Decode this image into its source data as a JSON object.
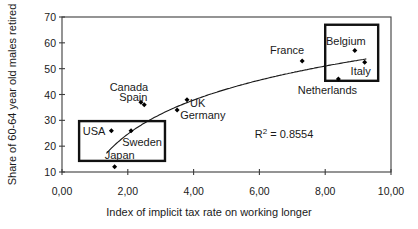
{
  "chart_data": {
    "type": "scatter",
    "title": "",
    "xlabel": "Index of implicit tax rate on working longer",
    "ylabel": "Share of 60-64 year old males retired",
    "xlim": [
      0,
      10
    ],
    "ylim": [
      10,
      70
    ],
    "grid": false,
    "legend": "none",
    "x_ticks": [
      {
        "value": 0,
        "label": "0,00"
      },
      {
        "value": 2,
        "label": "2,00"
      },
      {
        "value": 4,
        "label": "4,00"
      },
      {
        "value": 6,
        "label": "6,00"
      },
      {
        "value": 8,
        "label": "8,00"
      },
      {
        "value": 10,
        "label": "10,00"
      }
    ],
    "y_ticks": [
      {
        "value": 70,
        "label": "70"
      },
      {
        "value": 60,
        "label": "60"
      },
      {
        "value": 50,
        "label": "50"
      },
      {
        "value": 40,
        "label": "40"
      },
      {
        "value": 30,
        "label": "30"
      },
      {
        "value": 20,
        "label": "20"
      },
      {
        "value": 10,
        "label": "10"
      }
    ],
    "points": [
      {
        "name": "USA",
        "x": 1.5,
        "y": 26,
        "label_anchor": "end",
        "label_dx": -6,
        "label_dy": 4
      },
      {
        "name": "Japan",
        "x": 1.6,
        "y": 12,
        "label_anchor": "middle",
        "label_dx": 5,
        "label_dy": -8
      },
      {
        "name": "Sweden",
        "x": 2.1,
        "y": 26,
        "label_anchor": "middle",
        "label_dx": 11,
        "label_dy": 15
      },
      {
        "name": "Canada",
        "x": 2.4,
        "y": 37,
        "label_anchor": "middle",
        "label_dx": -12,
        "label_dy": -11
      },
      {
        "name": "Spain",
        "x": 2.5,
        "y": 36,
        "label_anchor": "middle",
        "label_dx": -11,
        "label_dy": -4
      },
      {
        "name": "Germany",
        "x": 3.5,
        "y": 34,
        "label_anchor": "start",
        "label_dx": 3,
        "label_dy": 9
      },
      {
        "name": "UK",
        "x": 3.8,
        "y": 38,
        "label_anchor": "start",
        "label_dx": 3,
        "label_dy": 7
      },
      {
        "name": "France",
        "x": 7.3,
        "y": 53,
        "label_anchor": "end",
        "label_dx": 2,
        "label_dy": -7
      },
      {
        "name": "Netherlands",
        "x": 8.4,
        "y": 46,
        "label_anchor": "middle",
        "label_dx": -11,
        "label_dy": 15
      },
      {
        "name": "Belgium",
        "x": 8.9,
        "y": 57,
        "label_anchor": "middle",
        "label_dx": -9,
        "label_dy": -6
      },
      {
        "name": "Italy",
        "x": 9.2,
        "y": 52.5,
        "label_anchor": "middle",
        "label_dx": -4,
        "label_dy": 13
      }
    ],
    "trendline": {
      "type": "logarithmic",
      "a": 11.5,
      "b": 19,
      "x_start": 1.35,
      "x_end": 9.25
    },
    "r_squared": 0.8554,
    "annotation": {
      "base": "R",
      "sup": "2",
      "rest": " = 0.8554",
      "x": 6.75,
      "y": 24.7
    },
    "highlight_boxes": [
      {
        "name": "low-tax-group",
        "x0": 0.52,
        "x1": 3.13,
        "y0": 14.3,
        "y1": 29.7
      },
      {
        "name": "high-tax-group",
        "x0": 8.0,
        "x1": 9.61,
        "y0": 45.3,
        "y1": 67.0
      }
    ],
    "colors": {
      "background": "#ffffff",
      "marker": "#000000",
      "trendline": "#1a1a1a",
      "frame": "#3d3d3d",
      "highlight_box": "#111111",
      "text": "#1a1a1a"
    }
  }
}
